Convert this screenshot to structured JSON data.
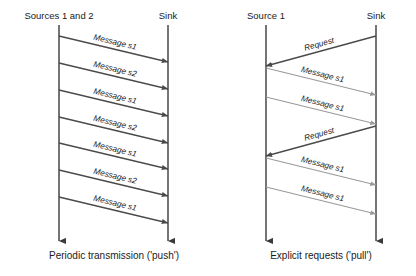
{
  "figure": {
    "width": 416,
    "height": 276,
    "background": "#ffffff",
    "colors": {
      "lifeline": "#3a3a3a",
      "arrow_dark": "#4a4a4a",
      "arrow_light": "#9a9a9a",
      "text": "#1a1a1a"
    }
  },
  "panels": [
    {
      "id": "push",
      "caption": "Periodic transmission ('push')",
      "actors": [
        {
          "id": "sources",
          "label": "Sources 1 and 2",
          "x": 59,
          "label_x": 59,
          "label_y": 19
        },
        {
          "id": "sink",
          "label": "Sink",
          "x": 168,
          "label_x": 168,
          "label_y": 19
        }
      ],
      "lifeline_top": 25,
      "lifeline_bottom": 241,
      "caption_x": 114,
      "caption_y": 259,
      "messages": [
        {
          "label": "Message s1",
          "from": "sources",
          "to": "sink",
          "x1": 59,
          "y1": 36,
          "x2": 168,
          "y2": 62,
          "style": "dark"
        },
        {
          "label": "Message s2",
          "from": "sources",
          "to": "sink",
          "x1": 59,
          "y1": 63,
          "x2": 168,
          "y2": 89,
          "style": "dark"
        },
        {
          "label": "Message s1",
          "from": "sources",
          "to": "sink",
          "x1": 59,
          "y1": 90,
          "x2": 168,
          "y2": 116,
          "style": "dark"
        },
        {
          "label": "Message s2",
          "from": "sources",
          "to": "sink",
          "x1": 59,
          "y1": 117,
          "x2": 168,
          "y2": 143,
          "style": "dark"
        },
        {
          "label": "Message s1",
          "from": "sources",
          "to": "sink",
          "x1": 59,
          "y1": 143,
          "x2": 168,
          "y2": 169,
          "style": "dark"
        },
        {
          "label": "Message s2",
          "from": "sources",
          "to": "sink",
          "x1": 59,
          "y1": 170,
          "x2": 168,
          "y2": 196,
          "style": "dark"
        },
        {
          "label": "Message s1",
          "from": "sources",
          "to": "sink",
          "x1": 59,
          "y1": 197,
          "x2": 168,
          "y2": 223,
          "style": "dark"
        }
      ]
    },
    {
      "id": "pull",
      "caption": "Explicit requests ('pull')",
      "actors": [
        {
          "id": "source1",
          "label": "Source 1",
          "x": 266,
          "label_x": 266,
          "label_y": 19
        },
        {
          "id": "sink2",
          "label": "Sink",
          "x": 376,
          "label_x": 376,
          "label_y": 19
        }
      ],
      "lifeline_top": 25,
      "lifeline_bottom": 241,
      "caption_x": 321,
      "caption_y": 259,
      "messages": [
        {
          "label": "Request",
          "from": "sink2",
          "to": "source1",
          "x1": 376,
          "y1": 36,
          "x2": 266,
          "y2": 66,
          "style": "dark"
        },
        {
          "label": "Message s1",
          "from": "source1",
          "to": "sink2",
          "x1": 266,
          "y1": 68,
          "x2": 376,
          "y2": 95,
          "style": "light"
        },
        {
          "label": "Message s1",
          "from": "source1",
          "to": "sink2",
          "x1": 266,
          "y1": 97,
          "x2": 376,
          "y2": 124,
          "style": "light"
        },
        {
          "label": "Request",
          "from": "sink2",
          "to": "source1",
          "x1": 376,
          "y1": 126,
          "x2": 266,
          "y2": 156,
          "style": "dark"
        },
        {
          "label": "Message s1",
          "from": "source1",
          "to": "sink2",
          "x1": 266,
          "y1": 158,
          "x2": 376,
          "y2": 185,
          "style": "light"
        },
        {
          "label": "Message s1",
          "from": "source1",
          "to": "sink2",
          "x1": 266,
          "y1": 187,
          "x2": 376,
          "y2": 214,
          "style": "light"
        }
      ]
    }
  ]
}
